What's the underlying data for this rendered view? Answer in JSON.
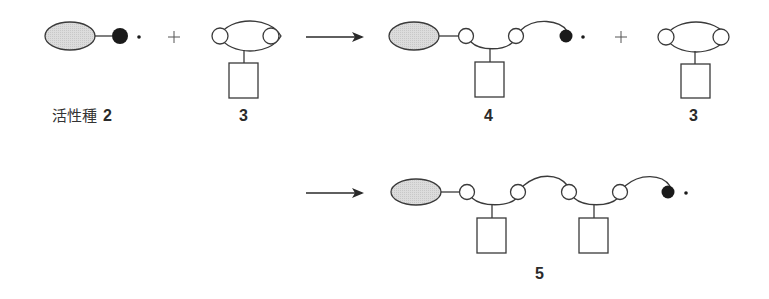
{
  "diagram": {
    "row1": {
      "active_species": {
        "label_jp": "活性種",
        "label_num": "2"
      },
      "plus_1": "+",
      "monomer_1": {
        "label": "3"
      },
      "arrow_1": "→",
      "intermediate": {
        "label": "4"
      },
      "plus_2": "+",
      "monomer_2": {
        "label": "3"
      }
    },
    "row2": {
      "arrow_2": "→",
      "product": {
        "label": "5"
      }
    },
    "radical_symbol": "·",
    "colors": {
      "stroke": "#3a3a3a",
      "ellipse_fill": "#d9d9d9",
      "radical_fill": "#1a1a1a",
      "open_circle_fill": "#ffffff"
    }
  }
}
